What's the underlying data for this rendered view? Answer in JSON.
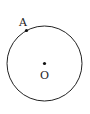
{
  "diagram": {
    "type": "geometry",
    "circle": {
      "cx": 44.5,
      "cy": 63.5,
      "r": 37.5,
      "stroke": "#222222"
    },
    "points": [
      {
        "id": "A",
        "label": "A",
        "x": 26.5,
        "y": 30.5,
        "label_x": 19,
        "label_y": 26
      },
      {
        "id": "O",
        "label": "O",
        "x": 44.5,
        "y": 63.5,
        "label_x": 40,
        "label_y": 79
      }
    ]
  }
}
